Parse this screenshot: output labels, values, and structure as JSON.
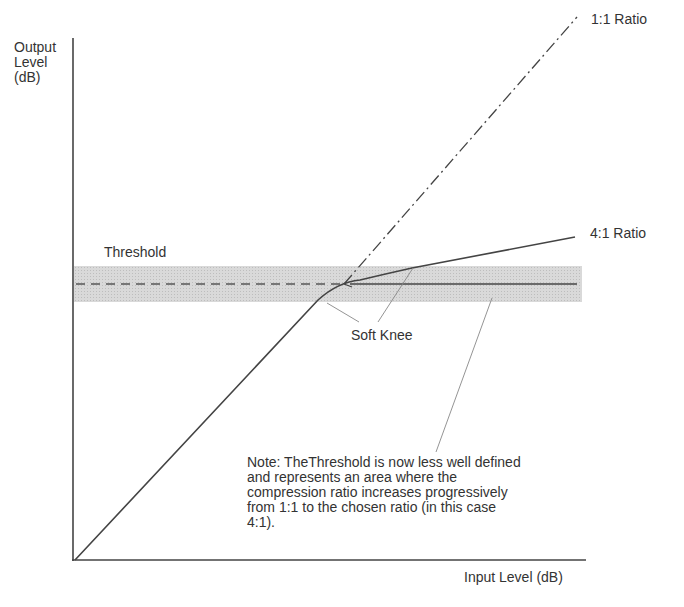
{
  "diagram": {
    "type": "compressor-transfer-curve",
    "y_axis_label_lines": [
      "Output",
      "Level",
      "(dB)"
    ],
    "x_axis_label": "Input Level (dB)",
    "labels": {
      "ratio_1_1": "1:1 Ratio",
      "ratio_4_1": "4:1 Ratio",
      "threshold": "Threshold",
      "soft_knee": "Soft Knee"
    },
    "note_lines": [
      "Note: TheThreshold is now less well defined",
      "and represents an area where the",
      "compression ratio increases progressively",
      "from 1:1 to the chosen ratio (in this case",
      "4:1)."
    ],
    "colors": {
      "line": "#444444",
      "band": "#d4d4d4",
      "leader": "#888888",
      "text": "#333333"
    }
  }
}
